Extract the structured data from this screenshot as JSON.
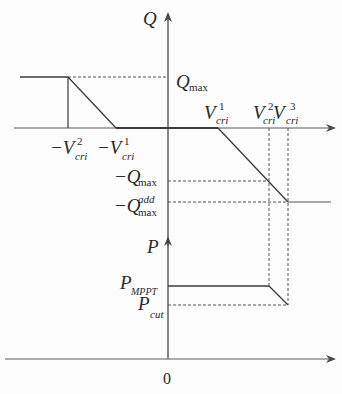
{
  "diagram": {
    "type": "control-characteristic",
    "upper_plot": {
      "y_axis_label": "Q",
      "x_axis": "V (voltage deviation)",
      "labels": {
        "q_max": {
          "base": "Q",
          "sub": "max"
        },
        "neg_q_max": {
          "base": "−Q",
          "sub": "max"
        },
        "neg_q_max_add": {
          "base": "−Q",
          "sub": "max",
          "sup": "add"
        },
        "neg_v_cri_2": {
          "base": "−V",
          "sub": "cri",
          "sup": "2"
        },
        "neg_v_cri_1": {
          "base": "−V",
          "sub": "cri",
          "sup": "1"
        },
        "v_cri_1": {
          "base": "V",
          "sub": "cri",
          "sup": "1"
        },
        "v_cri_2": {
          "base": "V",
          "sub": "cri",
          "sup": "2"
        },
        "v_cri_3": {
          "base": "V",
          "sub": "cri",
          "sup": "3"
        }
      }
    },
    "lower_plot": {
      "y_axis_label": "P",
      "origin_label": "0",
      "labels": {
        "p_mppt": {
          "base": "P",
          "sub": "MPPT"
        },
        "p_cut": {
          "base": "P",
          "sub": "cut"
        }
      }
    },
    "colors": {
      "line": "#3a3a3a",
      "dashed": "#555555",
      "background": "#fdfdfd"
    }
  }
}
